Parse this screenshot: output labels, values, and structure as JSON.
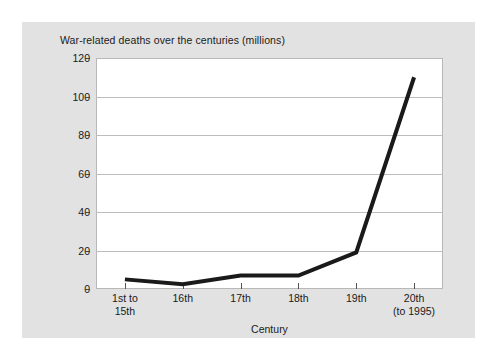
{
  "chart_data": {
    "type": "line",
    "title": "War-related deaths over the centuries (millions)",
    "xlabel": "Century",
    "ylabel": "",
    "categories": [
      "1st to 15th",
      "16th",
      "17th",
      "18th",
      "19th",
      "20th (to 1995)"
    ],
    "category_lines": [
      [
        "1st to",
        "15th"
      ],
      [
        "16th"
      ],
      [
        "17th"
      ],
      [
        "18th"
      ],
      [
        "19th"
      ],
      [
        "20th",
        "(to 1995)"
      ]
    ],
    "values": [
      5,
      2.5,
      7,
      7,
      19,
      110
    ],
    "ylim": [
      0,
      120
    ],
    "yticks": [
      0,
      20,
      40,
      60,
      80,
      100,
      120
    ],
    "grid": true,
    "legend": "none",
    "line_color": "#1a1a1a",
    "line_width": 4,
    "plot_background": "#ffffff",
    "figure_background": "#e2e2e2",
    "gridline_color": "#bdbdbd"
  }
}
